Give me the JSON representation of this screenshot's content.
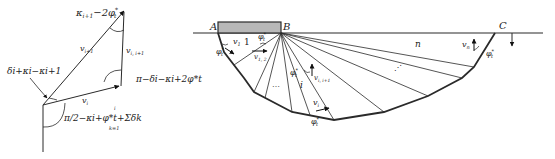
{
  "hodograph": {
    "labels": {
      "top_angle": "κ",
      "top_angle_sub": "i+1",
      "top_angle_rest": "−2φ",
      "top_angle_sup": "*",
      "top_angle_sub2": "t",
      "v_i1": "v",
      "v_i1_sub": "i+1",
      "v_ii1": "v",
      "v_ii1_sub": "i, i+1",
      "left_angle": "δ",
      "left_angle_full": "δi+κi−κi+1",
      "right_angle": "π−δi−κi+2φ*t",
      "v_i": "v",
      "v_i_sub": "i",
      "bottom_angle": "π/2−κi+φ*t+Σδk",
      "sum_upper": "i",
      "sum_lower": "k=1"
    }
  },
  "mechanism": {
    "points": {
      "A": "A",
      "B": "B",
      "C": "C"
    },
    "labels": {
      "v1": "v",
      "v1_sub": "1",
      "block1": "1",
      "v12": "v",
      "v12_sub": "1, 2",
      "phi": "φ",
      "phi_sup": "*",
      "phi_sub": "t",
      "dots": "…",
      "i": "i",
      "vii1": "v",
      "vii1_sub": "i, i+1",
      "vi": "v",
      "vi_sub": "i",
      "n": "n",
      "vn": "v",
      "vn_sub": "n",
      "diag_dots": "⋰"
    }
  },
  "colors": {
    "line": "#2a2a2a",
    "footing_fill": "#b8b8b8",
    "background": "#ffffff"
  }
}
